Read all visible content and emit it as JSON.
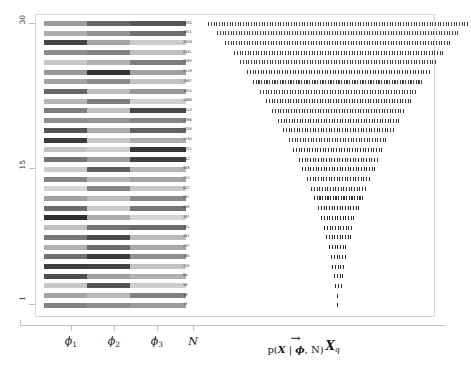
{
  "figure": {
    "type": "heatmap-and-sample-strip-plot",
    "background_color": "#ffffff",
    "frame_color": "#d8d8d8",
    "axis_color": "#c2c2c2"
  },
  "y_axis": {
    "tick_labels": [
      "30",
      "15",
      "1"
    ],
    "tick_values": [
      30,
      15,
      1
    ],
    "range": [
      1,
      30
    ]
  },
  "x_axis": {
    "tick_labels": [
      {
        "base": "ϕ",
        "sub": "1",
        "name": "phi-1"
      },
      {
        "base": "ϕ",
        "sub": "2",
        "name": "phi-2"
      },
      {
        "base": "ϕ",
        "sub": "3",
        "name": "phi-3"
      },
      {
        "base": "N",
        "sub": "",
        "name": "N"
      }
    ]
  },
  "captions": {
    "arrow": "→",
    "density_formula_prefix": "p(",
    "density_formula_X": "X",
    "density_formula_mid": " | ",
    "density_formula_phi": "ϕ",
    "density_formula_suffix": ", N)",
    "xq_base": "X",
    "xq_sub": "q"
  },
  "chart_data": {
    "type": "heatmap",
    "title": "",
    "xlabel": "",
    "ylabel": "",
    "n_rows": 30,
    "row_index_top_to_bottom": [
      30,
      29,
      28,
      27,
      26,
      25,
      24,
      23,
      22,
      21,
      20,
      19,
      18,
      17,
      16,
      15,
      14,
      13,
      12,
      11,
      10,
      9,
      8,
      7,
      6,
      5,
      4,
      3,
      2,
      1
    ],
    "columns": [
      "phi_1",
      "phi_2",
      "phi_3",
      "N",
      "X_q"
    ],
    "N_values": [
      3030,
      2811,
      2628,
      2431,
      2260,
      2118,
      1987,
      1825,
      1668,
      1510,
      1386,
      1258,
      1130,
      1021,
      912,
      808,
      712,
      622,
      537,
      459,
      387,
      321,
      261,
      207,
      160,
      119,
      84,
      56,
      33,
      13
    ],
    "phi_1": [
      0.38,
      0.3,
      0.78,
      0.45,
      0.18,
      0.4,
      0.35,
      0.62,
      0.26,
      0.52,
      0.44,
      0.7,
      0.82,
      0.2,
      0.56,
      0.16,
      0.48,
      0.12,
      0.36,
      0.6,
      0.88,
      0.22,
      0.54,
      0.28,
      0.58,
      0.8,
      0.74,
      0.18,
      0.34,
      0.5
    ],
    "phi_2": [
      0.62,
      0.42,
      0.34,
      0.5,
      0.28,
      0.86,
      0.46,
      0.24,
      0.52,
      0.2,
      0.4,
      0.3,
      0.18,
      0.14,
      0.38,
      0.66,
      0.26,
      0.48,
      0.22,
      0.16,
      0.3,
      0.56,
      0.74,
      0.6,
      0.82,
      0.78,
      0.36,
      0.7,
      0.24,
      0.44
    ],
    "phi_3": [
      0.7,
      0.58,
      0.16,
      0.22,
      0.52,
      0.36,
      0.2,
      0.4,
      0.14,
      0.76,
      0.48,
      0.64,
      0.3,
      0.84,
      0.8,
      0.26,
      0.34,
      0.18,
      0.46,
      0.54,
      0.12,
      0.6,
      0.24,
      0.32,
      0.42,
      0.2,
      0.28,
      0.15,
      0.5,
      0.38
    ],
    "sample_widths_frac": [
      1.0,
      0.93,
      0.87,
      0.8,
      0.75,
      0.7,
      0.655,
      0.6,
      0.555,
      0.505,
      0.465,
      0.42,
      0.38,
      0.345,
      0.305,
      0.275,
      0.24,
      0.212,
      0.185,
      0.158,
      0.135,
      0.113,
      0.094,
      0.076,
      0.06,
      0.046,
      0.034,
      0.024,
      0.015,
      0.008
    ],
    "colormap": "greys",
    "grid": false,
    "legend": false
  }
}
